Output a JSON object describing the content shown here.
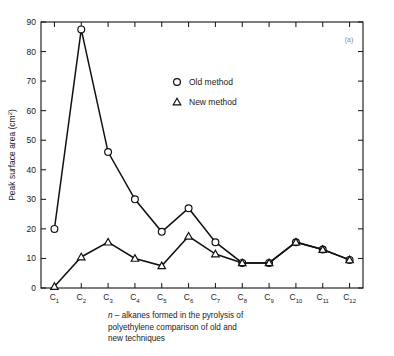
{
  "figure": {
    "panel_label": "(a)",
    "caption_lines": [
      "n – alkanes formed in the pyrolysis of",
      "polyethylene comparison of old and",
      "new techniques"
    ],
    "caption_italic_prefix": "n"
  },
  "chart_data": {
    "type": "line",
    "title": "",
    "xlabel": "",
    "ylabel": "Peak surface area (cm²)",
    "ylabel_base": "Peak surface area (cm",
    "ylabel_sup": "2",
    "ylabel_close": ")",
    "categories": [
      "C1",
      "C2",
      "C3",
      "C4",
      "C5",
      "C6",
      "C7",
      "C8",
      "C9",
      "C10",
      "C11",
      "C12"
    ],
    "category_labels": [
      {
        "base": "C",
        "sub": "1"
      },
      {
        "base": "C",
        "sub": "2"
      },
      {
        "base": "C",
        "sub": "3"
      },
      {
        "base": "C",
        "sub": "4"
      },
      {
        "base": "C",
        "sub": "5"
      },
      {
        "base": "C",
        "sub": "6"
      },
      {
        "base": "C",
        "sub": "7"
      },
      {
        "base": "C",
        "sub": "8"
      },
      {
        "base": "C",
        "sub": "9"
      },
      {
        "base": "C",
        "sub": "10"
      },
      {
        "base": "C",
        "sub": "11"
      },
      {
        "base": "C",
        "sub": "12"
      }
    ],
    "ylim": [
      0,
      90
    ],
    "yticks": [
      0,
      10,
      20,
      30,
      40,
      50,
      60,
      70,
      80,
      90
    ],
    "grid": false,
    "legend_position": "upper-center",
    "series": [
      {
        "name": "Old method",
        "marker": "circle",
        "values": [
          20,
          87.5,
          46,
          30,
          19,
          27,
          15.5,
          8.5,
          8.5,
          15.5,
          13,
          9.5
        ]
      },
      {
        "name": "New method",
        "marker": "triangle",
        "values": [
          0.5,
          10.5,
          15.5,
          10,
          7.5,
          17.5,
          11.5,
          8.5,
          8.5,
          15.5,
          13,
          9.5
        ]
      }
    ],
    "legend": [
      {
        "label": "Old method",
        "marker": "circle"
      },
      {
        "label": "New method",
        "marker": "triangle"
      }
    ]
  },
  "colors": {
    "ink": "#111111",
    "background": "#ffffff",
    "panel_label": "#8a8a8a"
  }
}
